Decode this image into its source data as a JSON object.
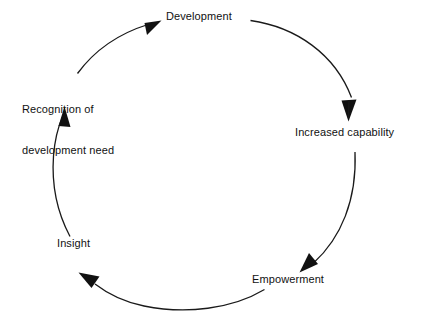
{
  "diagram": {
    "shape": "closed-loop-circle",
    "direction": "clockwise",
    "background_color": "#ffffff",
    "stroke_color": "#1a1a1a",
    "text_color": "#111111",
    "nodes": [
      {
        "id": "development",
        "label": "Development",
        "position": "top",
        "lines": [
          "Development"
        ]
      },
      {
        "id": "increased-capability",
        "label": "Increased capability",
        "position": "right",
        "lines": [
          "Increased capability"
        ]
      },
      {
        "id": "empowerment",
        "label": "Empowerment",
        "position": "bottom-right",
        "lines": [
          "Empowerment"
        ]
      },
      {
        "id": "insight",
        "label": "Insight",
        "position": "bottom-left",
        "lines": [
          "Insight"
        ]
      },
      {
        "id": "recognition-of-development-need",
        "label": "Recognition of development need",
        "position": "left",
        "lines": [
          "Recognition of",
          "development need"
        ]
      }
    ],
    "arrows": [
      {
        "id": "arrow-development-to-increased-capability",
        "from": "development",
        "to": "increased-capability"
      },
      {
        "id": "arrow-increased-capability-to-empowerment",
        "from": "increased-capability",
        "to": "empowerment"
      },
      {
        "id": "arrow-empowerment-to-insight",
        "from": "empowerment",
        "to": "insight"
      },
      {
        "id": "arrow-insight-to-recognition",
        "from": "insight",
        "to": "recognition-of-development-need"
      },
      {
        "id": "arrow-recognition-to-development",
        "from": "recognition-of-development-need",
        "to": "development"
      }
    ]
  }
}
